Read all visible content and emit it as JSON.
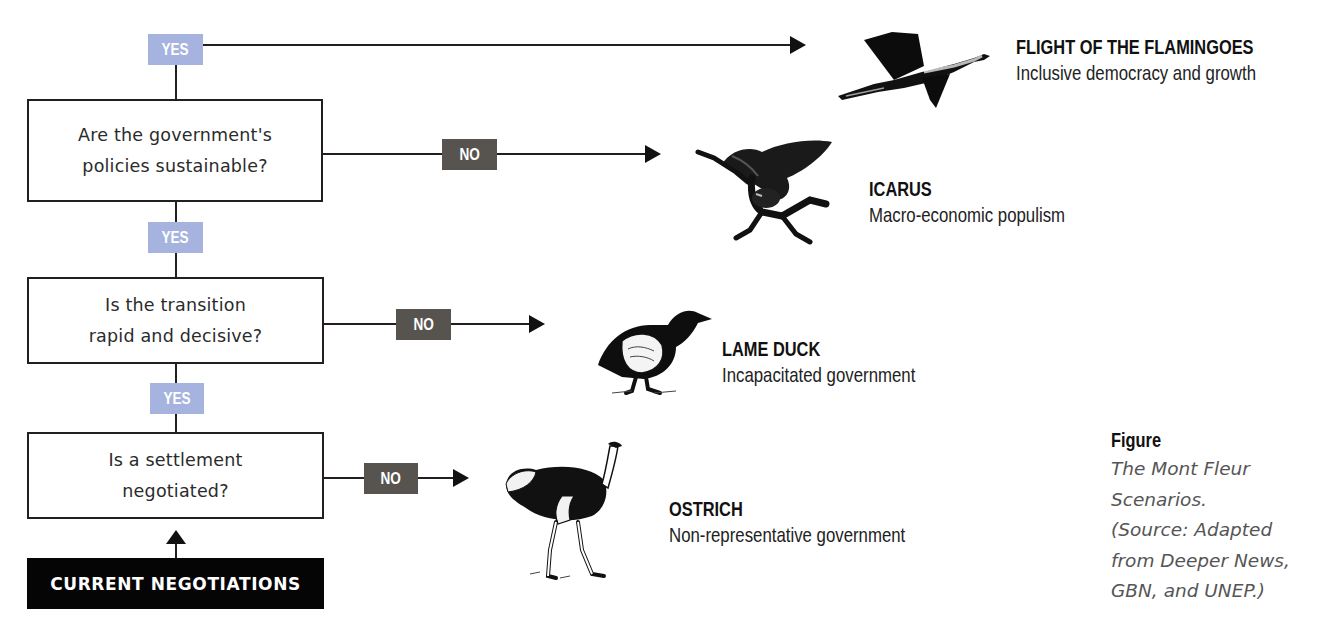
{
  "diagram": {
    "type": "decision-flowchart",
    "start": {
      "label": "CURRENT NEGOTIATIONS"
    },
    "questions": [
      {
        "id": "q1",
        "text": "Are the government's\npolicies sustainable?",
        "yes_label": "YES",
        "no_label": "NO"
      },
      {
        "id": "q2",
        "text": "Is the transition\nrapid and decisive?",
        "yes_label": "YES",
        "no_label": "NO"
      },
      {
        "id": "q3",
        "text": "Is a settlement\nnegotiated?",
        "yes_label": "YES",
        "no_label": "NO"
      }
    ],
    "outcomes": [
      {
        "id": "flamingoes",
        "title": "FLIGHT OF THE FLAMINGOES",
        "description": "Inclusive democracy and growth",
        "icon": "flamingo-icon"
      },
      {
        "id": "icarus",
        "title": "ICARUS",
        "description": "Macro-economic populism",
        "icon": "icarus-icon"
      },
      {
        "id": "lame-duck",
        "title": "LAME DUCK",
        "description": "Incapacitated government",
        "icon": "duck-icon"
      },
      {
        "id": "ostrich",
        "title": "OSTRICH",
        "description": "Non-representative government",
        "icon": "ostrich-icon"
      }
    ],
    "edges": [
      {
        "from": "start",
        "to": "q3",
        "label": ""
      },
      {
        "from": "q3",
        "to": "q2",
        "label": "YES"
      },
      {
        "from": "q3",
        "to": "ostrich",
        "label": "NO"
      },
      {
        "from": "q2",
        "to": "q1",
        "label": "YES"
      },
      {
        "from": "q2",
        "to": "lame-duck",
        "label": "NO"
      },
      {
        "from": "q1",
        "to": "flamingoes",
        "label": "YES"
      },
      {
        "from": "q1",
        "to": "icarus",
        "label": "NO"
      }
    ],
    "colors": {
      "yes": "#a6b3de",
      "no": "#57534f",
      "start": "#050505",
      "line": "#231f20"
    }
  },
  "caption": {
    "title": "Figure",
    "body": "The Mont Fleur\nScenarios.\n(Source: Adapted\nfrom Deeper News,\nGBN, and UNEP.)"
  }
}
